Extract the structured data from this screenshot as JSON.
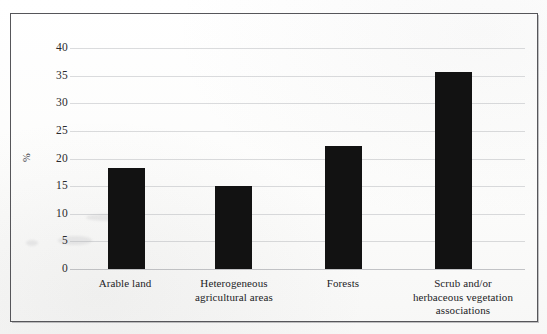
{
  "chart_data": {
    "type": "bar",
    "title": "",
    "xlabel": "",
    "ylabel": "%",
    "categories": [
      "Arable land",
      "Heterogeneous agricultural areas",
      "Forests",
      "Scrub and/or herbaceous vegetation associations"
    ],
    "category_lines": [
      [
        "Arable land"
      ],
      [
        "Heterogeneous",
        "agricultural areas"
      ],
      [
        "Forests"
      ],
      [
        "Scrub and/or",
        "herbaceous vegetation",
        "associations"
      ]
    ],
    "values": [
      18.3,
      15.0,
      22.3,
      35.7
    ],
    "ylim": [
      0,
      40
    ],
    "yticks": [
      0,
      5,
      10,
      15,
      20,
      25,
      30,
      35,
      40
    ],
    "ytick_labels": [
      "0",
      "5",
      "10",
      "15",
      "20",
      "25",
      "30",
      "35",
      "40"
    ],
    "grid": true,
    "legend": false,
    "bar_color": "#121212",
    "grid_color": "#a5a8ac",
    "frame_color": "#56565a"
  }
}
